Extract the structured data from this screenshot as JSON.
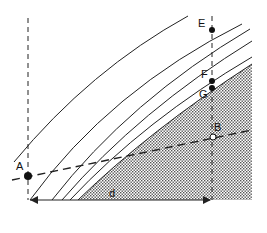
{
  "diagram": {
    "points": {
      "A": {
        "label": "A",
        "x": 28,
        "y": 176,
        "marker": "filled"
      },
      "B": {
        "label": "B",
        "x": 213,
        "y": 138,
        "marker": "open"
      },
      "E": {
        "label": "E",
        "x": 212,
        "y": 30,
        "marker": "filled"
      },
      "F": {
        "label": "F",
        "x": 212,
        "y": 81,
        "marker": "filled"
      },
      "G": {
        "label": "G",
        "x": 212,
        "y": 88,
        "marker": "filled"
      }
    },
    "distance_label": "d",
    "colors": {
      "line": "#222222",
      "shade_dot": "#555555",
      "background": "#ffffff"
    }
  }
}
